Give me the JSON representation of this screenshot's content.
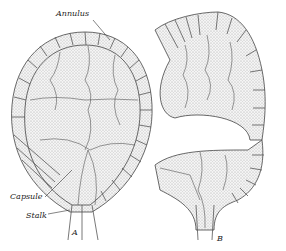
{
  "figure": {
    "labels": {
      "annulus": "Annulus",
      "capsule": "Capsule",
      "stalk": "Stalk",
      "panel_a": "A",
      "panel_b": "B"
    },
    "colors": {
      "ink": "#333333",
      "stipple": "#d8d8d8",
      "background": "#ffffff"
    }
  }
}
